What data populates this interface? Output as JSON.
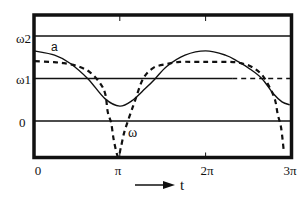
{
  "chart_data": {
    "type": "line",
    "title": "",
    "xlabel": "t",
    "ylabel": "",
    "x_unit": "π",
    "xlim_pi": [
      0,
      3
    ],
    "ylim": [
      -0.87,
      2.49
    ],
    "grid": "horizontal reference lines at 0, ω1, ω2",
    "legend": "none (curves labelled inline)",
    "x_ticks": [
      {
        "label": "0",
        "value_pi": 0
      },
      {
        "label": "π",
        "value_pi": 1
      },
      {
        "label": "2π",
        "value_pi": 2
      },
      {
        "label": "3π",
        "value_pi": 3
      }
    ],
    "y_ticks": [
      {
        "label": "0",
        "value": 0
      },
      {
        "label": "ω1",
        "value": 1
      },
      {
        "label": "ω2",
        "value": 2
      }
    ],
    "y_lines": [
      {
        "value": 2,
        "style": "solid"
      },
      {
        "value": 1,
        "style": "solid",
        "dashed_from_pi": 2.31
      },
      {
        "value": 0,
        "style": "solid"
      }
    ],
    "series": [
      {
        "name": "a",
        "style": "solid",
        "x_pi": [
          0,
          0.24,
          0.42,
          0.63,
          0.83,
          1.0,
          1.15,
          1.29,
          1.41,
          1.55,
          1.76,
          2.0,
          2.23,
          2.37,
          2.52,
          2.66,
          2.79,
          2.89,
          2.98
        ],
        "y": [
          1.65,
          1.55,
          1.36,
          0.99,
          0.52,
          0.35,
          0.49,
          0.75,
          0.99,
          1.29,
          1.55,
          1.65,
          1.55,
          1.41,
          1.22,
          0.99,
          0.64,
          0.45,
          0.38
        ]
      },
      {
        "name": "ω",
        "style": "dashed",
        "x_pi": [
          0.01,
          0.19,
          0.35,
          0.51,
          0.65,
          0.77,
          0.83,
          0.86,
          0.9,
          0.93,
          0.98,
          1.01,
          1.05,
          1.11,
          1.18,
          1.27,
          1.39,
          1.55,
          1.7,
          1.99,
          2.28,
          2.41,
          2.54,
          2.66,
          2.75,
          2.81,
          2.84,
          2.88,
          2.91
        ],
        "y": [
          1.41,
          1.39,
          1.36,
          1.29,
          1.15,
          0.89,
          0.64,
          0.21,
          -0.05,
          -0.45,
          -0.85,
          -0.64,
          -0.28,
          0.09,
          0.49,
          0.99,
          1.25,
          1.34,
          1.39,
          1.39,
          1.39,
          1.36,
          1.27,
          1.08,
          0.78,
          0.49,
          0.16,
          -0.16,
          -0.68
        ]
      }
    ],
    "annotations": [
      {
        "text": "a",
        "near": "solid curve, t≈0.25π"
      },
      {
        "text": "ω",
        "near": "dashed curve, t≈1.15π, below zero line"
      },
      {
        "text": "t",
        "note": "time axis arrow below plot"
      }
    ]
  },
  "labels": {
    "y": {
      "w2": "ω2",
      "w1": "ω1",
      "zero": "0"
    },
    "x": {
      "zero": "0",
      "pi": "π",
      "two_pi": "2π",
      "three_pi": "3π"
    },
    "curve_a": "a",
    "curve_w": "ω",
    "time_axis": "t"
  }
}
